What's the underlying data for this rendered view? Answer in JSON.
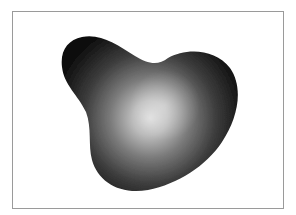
{
  "figure": {
    "colors": {
      "frame_border": "#9a9a9a",
      "background": "#ffffff",
      "shape_dark": "#1a1a1a",
      "shape_mid": "#5a5a5a",
      "shape_highlight": "#d8d8d8"
    }
  }
}
